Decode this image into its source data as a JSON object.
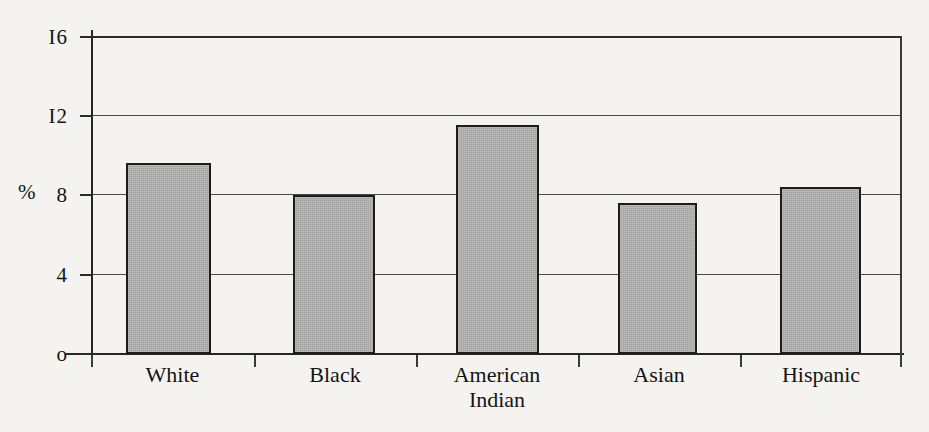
{
  "chart_data": {
    "type": "bar",
    "title": "",
    "subtitle": "",
    "xlabel": "",
    "ylabel": "%",
    "categories": [
      "White",
      "Black",
      "American Indian",
      "Asian",
      "Hispanic"
    ],
    "category_lines": [
      [
        "White"
      ],
      [
        "Black"
      ],
      [
        "American",
        "Indian"
      ],
      [
        "Asian"
      ],
      [
        "Hispanic"
      ]
    ],
    "values": [
      9.6,
      8.0,
      11.5,
      7.6,
      8.4
    ],
    "ylim": [
      0,
      16
    ],
    "yticks": [
      0,
      4,
      8,
      12,
      16
    ],
    "ytick_labels": [
      "o",
      "4",
      "8",
      "I2",
      "I6"
    ],
    "ytick_labels_plain": [
      "0",
      "4",
      "8",
      "12",
      "16"
    ],
    "grid": true,
    "grid_axis": "y",
    "legend": false,
    "legend_position": "none",
    "bar_fill_color": "#a3a3a3",
    "bar_border_color": "#1c1c1c",
    "background_color": "#f4f3f0",
    "axis_color": "#262626",
    "gridline_color": "#4a4a4a"
  }
}
